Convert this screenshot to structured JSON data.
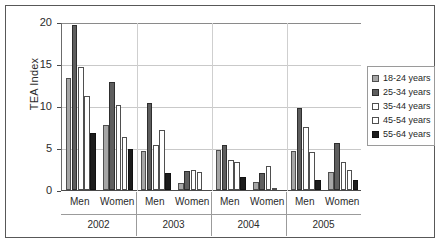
{
  "chart_data": {
    "type": "bar",
    "title": "",
    "xlabel": "",
    "ylabel": "TEA Index",
    "ylim": [
      0,
      20
    ],
    "yticks": [
      0,
      5,
      10,
      15,
      20
    ],
    "ytick_labels": [
      "0",
      "5",
      "10",
      "15",
      "20"
    ],
    "grid": true,
    "legend_position": "right",
    "categories": [
      "2002 Men",
      "2002 Women",
      "2003 Men",
      "2003 Women",
      "2004 Men",
      "2004 Women",
      "2005 Men",
      "2005 Women"
    ],
    "group_labels": [
      "Men",
      "Women"
    ],
    "year_labels": [
      "2002",
      "2003",
      "2004",
      "2005"
    ],
    "series": [
      {
        "name": "18-24 years",
        "color": "#a6a6a6",
        "values": [
          13.3,
          7.7,
          4.6,
          0.8,
          4.8,
          0.9,
          4.6,
          2.2
        ]
      },
      {
        "name": "25-34 years",
        "color": "#5e5e5e",
        "values": [
          19.7,
          12.8,
          10.4,
          2.3,
          5.3,
          2.0,
          9.8,
          5.6
        ]
      },
      {
        "name": "35-44 years",
        "color": "#ffffff",
        "values": [
          14.6,
          10.1,
          5.3,
          2.4,
          3.6,
          2.9,
          7.5,
          3.3
        ]
      },
      {
        "name": "45-54 years",
        "color": "#ffffff",
        "values": [
          11.2,
          6.3,
          7.1,
          2.2,
          3.3,
          0.1,
          4.5,
          2.4
        ]
      },
      {
        "name": "55-64 years",
        "color": "#1c1c1c",
        "values": [
          6.8,
          4.9,
          2.0,
          0.0,
          1.6,
          0.0,
          1.2,
          1.2
        ]
      }
    ]
  },
  "legend": {
    "items": [
      {
        "label": "18-24 years"
      },
      {
        "label": "25-34 years"
      },
      {
        "label": "35-44 years"
      },
      {
        "label": "45-54 years"
      },
      {
        "label": "55-64 years"
      }
    ]
  }
}
